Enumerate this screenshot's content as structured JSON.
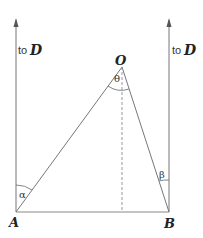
{
  "diagram": {
    "points": {
      "A": {
        "label": "A",
        "x": 16,
        "y": 212
      },
      "B": {
        "label": "B",
        "x": 169,
        "y": 212
      },
      "O": {
        "label": "O",
        "x": 122,
        "y": 67
      }
    },
    "arrows": {
      "left": {
        "prefix": "to",
        "target": "D"
      },
      "right": {
        "prefix": "to",
        "target": "D"
      }
    },
    "angles": {
      "alpha": "α",
      "beta": "β",
      "theta": "θ"
    },
    "colors": {
      "line": "#777777",
      "text": "#222222"
    }
  }
}
